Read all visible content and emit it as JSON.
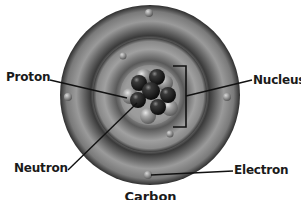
{
  "diagram": {
    "labels": {
      "proton": "Proton",
      "nucleus": "Nucleus",
      "neutron": "Neutron",
      "electron": "Electron"
    },
    "caption": "Carbon"
  },
  "colors": {
    "background": "#ffffff",
    "outer_shell": "#7a7a7a",
    "shell_dark": "#3a3a3a",
    "inner_shell": "#8c8c8c",
    "core": "#9a9a9a",
    "neutron": "#1e1e1e",
    "proton": "#9e9e9e",
    "leader_line": "#111111"
  }
}
